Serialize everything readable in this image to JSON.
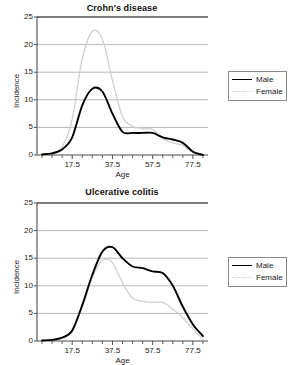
{
  "figure": {
    "width": 299,
    "height": 361,
    "background": "#ffffff",
    "panel_count": 2
  },
  "style": {
    "male_color": "#000000",
    "female_color": "#cfcfcf",
    "gridline_color": "#b8b8b8",
    "axis_color": "#4d4d4d",
    "legend_border": "#8a8a8a"
  },
  "chart_data": [
    {
      "type": "line",
      "title": "Crohn's disease",
      "xlabel": "Age",
      "ylabel": "Incidence",
      "xlim": [
        0,
        85
      ],
      "ylim": [
        0,
        25
      ],
      "yticks": [
        0,
        5,
        10,
        15,
        20,
        25
      ],
      "xticks": [
        17.5,
        37.5,
        57.5,
        77.5
      ],
      "xtick_labels": [
        "17.5",
        "37.5",
        "57.5",
        "77.5"
      ],
      "ytick_labels": [
        "0",
        "5",
        "10",
        "15",
        "20",
        "25"
      ],
      "minor_xticks": [
        2.5,
        7.5,
        12.5,
        22.5,
        27.5,
        32.5,
        42.5,
        47.5,
        52.5,
        62.5,
        67.5,
        72.5,
        82.5
      ],
      "grid": "horizontal",
      "legend_position": "right",
      "x": [
        2.5,
        7.5,
        12.5,
        17.5,
        22.5,
        27.5,
        32.5,
        37.5,
        42.5,
        47.5,
        52.5,
        57.5,
        62.5,
        67.5,
        72.5,
        77.5,
        82.5
      ],
      "series": [
        {
          "name": "Male",
          "style": "solid",
          "color": "#000000",
          "values": [
            0.1,
            0.3,
            1.0,
            3.2,
            9.0,
            12.0,
            11.5,
            7.5,
            4.2,
            4.0,
            4.0,
            4.0,
            3.2,
            2.8,
            2.2,
            0.6,
            0.0
          ]
        },
        {
          "name": "Female",
          "style": "dotted",
          "color": "#cfcfcf",
          "values": [
            0.1,
            0.3,
            1.5,
            6.5,
            17.5,
            22.4,
            21.0,
            13.5,
            7.0,
            5.2,
            4.8,
            4.6,
            3.0,
            2.2,
            1.7,
            0.5,
            0.0
          ]
        }
      ]
    },
    {
      "type": "line",
      "title": "Ulcerative colitis",
      "xlabel": "Age",
      "ylabel": "Incidence",
      "xlim": [
        0,
        85
      ],
      "ylim": [
        0,
        25
      ],
      "yticks": [
        0,
        5,
        10,
        15,
        20,
        25
      ],
      "xticks": [
        17.5,
        37.5,
        57.5,
        77.5
      ],
      "xtick_labels": [
        "17.5",
        "37.5",
        "57.5",
        "77.5"
      ],
      "ytick_labels": [
        "0",
        "5",
        "10",
        "15",
        "20",
        "25"
      ],
      "minor_xticks": [
        2.5,
        7.5,
        12.5,
        22.5,
        27.5,
        32.5,
        42.5,
        47.5,
        52.5,
        62.5,
        67.5,
        72.5,
        82.5
      ],
      "grid": "horizontal",
      "legend_position": "right",
      "x": [
        2.5,
        7.5,
        12.5,
        17.5,
        22.5,
        27.5,
        32.5,
        37.5,
        42.5,
        47.5,
        52.5,
        57.5,
        62.5,
        67.5,
        72.5,
        77.5,
        82.5
      ],
      "series": [
        {
          "name": "Male",
          "style": "solid",
          "color": "#000000",
          "values": [
            0.1,
            0.2,
            0.6,
            1.9,
            6.5,
            12.0,
            16.2,
            17.0,
            15.0,
            13.5,
            13.2,
            12.6,
            12.3,
            10.0,
            6.2,
            3.0,
            0.9
          ]
        },
        {
          "name": "Female",
          "style": "dotted",
          "color": "#cfcfcf",
          "values": [
            0.1,
            0.2,
            0.5,
            1.7,
            6.2,
            11.5,
            14.6,
            14.2,
            10.5,
            7.8,
            7.2,
            7.0,
            7.0,
            5.8,
            4.2,
            2.2,
            0.3
          ]
        }
      ]
    }
  ],
  "legends": [
    {
      "entries": [
        {
          "label": "Male",
          "style": "solid"
        },
        {
          "label": "Female",
          "style": "dotted"
        }
      ]
    },
    {
      "entries": [
        {
          "label": "Male",
          "style": "solid"
        },
        {
          "label": "Female",
          "style": "dotted"
        }
      ]
    }
  ]
}
